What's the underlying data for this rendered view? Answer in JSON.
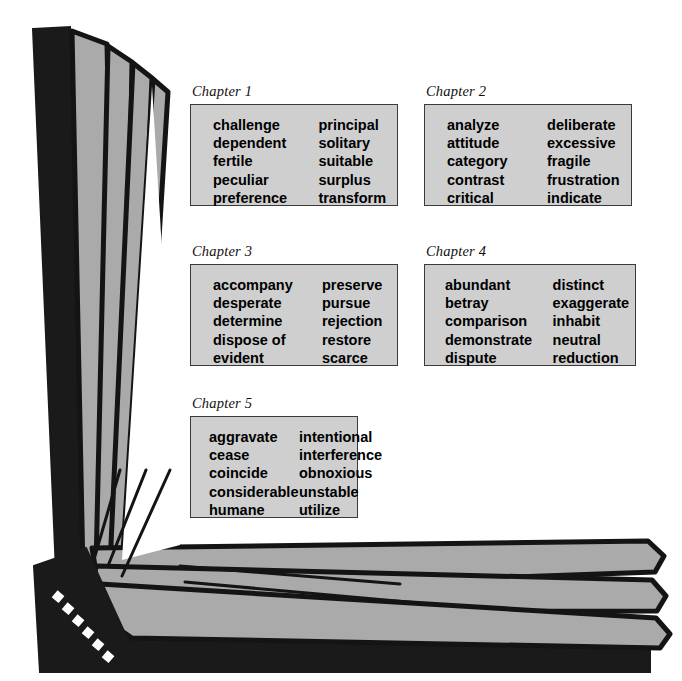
{
  "illustration": {
    "name": "open-book",
    "colors": {
      "page_fill": "#aaaaaa",
      "page_outline": "#1a1a1a",
      "cover_dark": "#1a1a1a",
      "background": "#ffffff",
      "box_fill": "#cfcfcf",
      "box_border": "#3a3a3a"
    }
  },
  "chapters": [
    {
      "label": "Chapter 1",
      "left_column": [
        "challenge",
        "dependent",
        "fertile",
        "peculiar",
        "preference"
      ],
      "right_column": [
        "principal",
        "solitary",
        "suitable",
        "surplus",
        "transform"
      ]
    },
    {
      "label": "Chapter 2",
      "left_column": [
        "analyze",
        "attitude",
        "category",
        "contrast",
        "critical"
      ],
      "right_column": [
        "deliberate",
        "excessive",
        "fragile",
        "frustration",
        "indicate"
      ]
    },
    {
      "label": "Chapter 3",
      "left_column": [
        "accompany",
        "desperate",
        "determine",
        "dispose of",
        "evident"
      ],
      "right_column": [
        "preserve",
        "pursue",
        "rejection",
        "restore",
        "scarce"
      ]
    },
    {
      "label": "Chapter 4",
      "left_column": [
        "abundant",
        "betray",
        "comparison",
        "demonstrate",
        "dispute"
      ],
      "right_column": [
        "distinct",
        "exaggerate",
        "inhabit",
        "neutral",
        "reduction"
      ]
    },
    {
      "label": "Chapter 5",
      "left_column": [
        "aggravate",
        "cease",
        "coincide",
        "considerable",
        "humane"
      ],
      "right_column": [
        "intentional",
        "interference",
        "obnoxious",
        "unstable",
        "utilize"
      ]
    }
  ]
}
